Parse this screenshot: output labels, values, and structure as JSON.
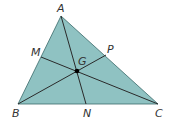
{
  "diagram": {
    "type": "triangle-cevians",
    "fill_color": "#8fc2c2",
    "line_color": "#2a2a2a",
    "vertices": {
      "A": [
        61,
        16
      ],
      "B": [
        18,
        104
      ],
      "C": [
        158,
        104
      ]
    },
    "points": {
      "M": [
        41,
        57
      ],
      "P": [
        106,
        55
      ],
      "N": [
        86,
        104
      ],
      "G": [
        77,
        71
      ]
    },
    "labels": {
      "A": "A",
      "B": "B",
      "C": "C",
      "M": "M",
      "P": "P",
      "N": "N",
      "G": "G"
    }
  }
}
